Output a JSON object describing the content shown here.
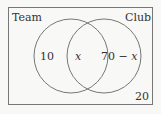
{
  "diagram": {
    "type": "venn",
    "sets": [
      "Team",
      "Club"
    ],
    "regions": {
      "team_only": "10",
      "both": "x",
      "club_only_num": "70 − ",
      "club_only_var": "x",
      "neither": "20"
    }
  }
}
